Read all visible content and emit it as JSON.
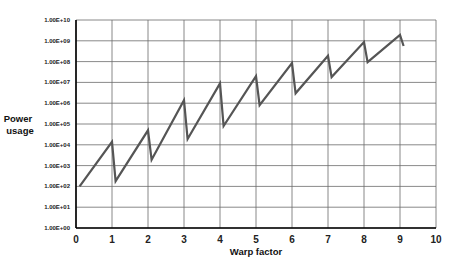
{
  "chart_data": {
    "type": "line",
    "title": "",
    "xlabel": "Warp factor",
    "ylabel": "Power usage",
    "yscale": "log",
    "xlim": [
      0,
      10
    ],
    "ylim": [
      1,
      10000000000
    ],
    "grid": true,
    "legend": null,
    "x_ticks": [
      "0",
      "1",
      "2",
      "3",
      "4",
      "5",
      "6",
      "7",
      "8",
      "9",
      "10"
    ],
    "y_ticks": [
      "1.00E+00",
      "1.00E+01",
      "1.00E+02",
      "1.00E+03",
      "1.00E+04",
      "1.00E+05",
      "1.00E+06",
      "1.00E+07",
      "1.00E+08",
      "1.00E+09",
      "1.00E+10"
    ],
    "series": [
      {
        "name": "Power usage",
        "color": "#555555",
        "x": [
          0.1,
          1.0,
          1.1,
          2.0,
          2.1,
          3.0,
          3.1,
          4.0,
          4.1,
          5.0,
          5.1,
          6.0,
          6.1,
          7.0,
          7.1,
          8.0,
          8.1,
          9.0,
          9.1
        ],
        "y": [
          100,
          14000,
          180,
          50000,
          1900,
          1400000,
          19000,
          9000000,
          80000,
          20000000,
          800000,
          85000000,
          3000000,
          190000000,
          18000000,
          870000000,
          95000000,
          1900000000,
          560000000
        ]
      }
    ]
  }
}
